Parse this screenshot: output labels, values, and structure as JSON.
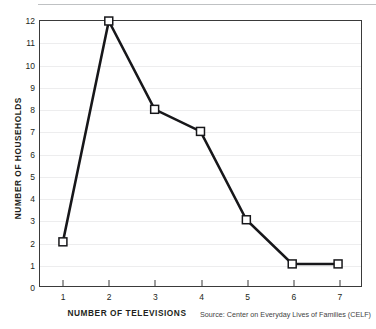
{
  "chart_data": {
    "type": "line",
    "title": "",
    "xlabel": "NUMBER OF TELEVISIONS",
    "ylabel": "NUMBER OF HOUSEHOLDS",
    "x": [
      1,
      2,
      3,
      4,
      5,
      6,
      7
    ],
    "values": [
      2,
      12,
      8,
      7,
      3,
      1,
      1
    ],
    "xticklabels": [
      "1",
      "2",
      "3",
      "4",
      "5",
      "6",
      "7"
    ],
    "yticklabels": [
      "0",
      "1",
      "2",
      "3",
      "4",
      "5",
      "6",
      "7",
      "8",
      "9",
      "10",
      "11",
      "12"
    ],
    "xlim": [
      0.5,
      7.5
    ],
    "ylim": [
      0,
      12
    ],
    "grid": "horizontal",
    "legend": "none",
    "marker": "white-square",
    "line_color": "#17171a",
    "marker_fill": "#ffffff",
    "marker_edge": "#17171a",
    "grid_color": "#ededee",
    "axis_color": "#3a3a3a",
    "source": "Source: Center on Everyday Lives of Families (CELF)"
  }
}
